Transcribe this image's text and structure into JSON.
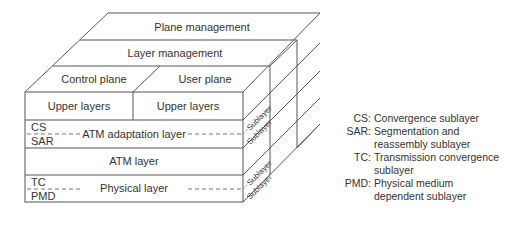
{
  "diagram": {
    "type": "ATM protocol reference model cube",
    "top_faces": {
      "plane_management": "Plane management",
      "layer_management": "Layer management",
      "control_plane": "Control plane",
      "user_plane": "User plane"
    },
    "front_face": {
      "upper_layers_left": "Upper layers",
      "upper_layers_right": "Upper layers",
      "aal": {
        "label": "ATM adaptation layer",
        "sub_top": "CS",
        "sub_bottom": "SAR"
      },
      "atm_layer": "ATM layer",
      "physical": {
        "label": "Physical layer",
        "sub_top": "TC",
        "sub_bottom": "PMD"
      }
    },
    "side_face": {
      "sublayer_label": "Sublayer"
    }
  },
  "legend": [
    {
      "key": "CS:",
      "value": "Convergence sublayer"
    },
    {
      "key": "SAR:",
      "value": "Segmentation and reassembly sublayer"
    },
    {
      "key": "TC:",
      "value": "Transmission convergence sublayer"
    },
    {
      "key": "PMD:",
      "value": "Physical medium dependent sublayer"
    }
  ],
  "colors": {
    "line": "#555555",
    "dashed": "#777777",
    "text": "#333333",
    "background": "#ffffff"
  }
}
